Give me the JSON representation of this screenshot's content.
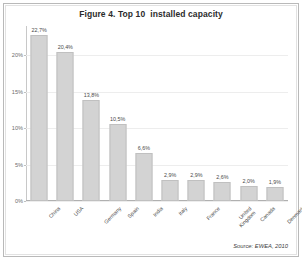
{
  "chart_data": {
    "type": "bar",
    "title": "Figure 4. Top 10  installed capacity",
    "xlabel": "",
    "ylabel": "",
    "ylim": [
      0,
      24
    ],
    "grid": true,
    "legend": "none",
    "orientation": "vertical",
    "categories": [
      "China",
      "USA",
      "Germany",
      "Spain",
      "India",
      "Italy",
      "France",
      "United\nKingdom",
      "Canada",
      "Denmark"
    ],
    "values": [
      22.7,
      20.4,
      13.8,
      10.5,
      6.6,
      2.9,
      2.9,
      2.6,
      2.0,
      1.9
    ],
    "data_labels": [
      "22,7%",
      "20,4%",
      "13,8%",
      "10,5%",
      "6,6%",
      "2,9%",
      "2,9%",
      "2,6%",
      "2,0%",
      "1,9%"
    ],
    "ytick_values": [
      0,
      5,
      10,
      15,
      20
    ],
    "ytick_labels": [
      "0%",
      "5%",
      "10%",
      "15%",
      "20%"
    ],
    "annotations": [
      "Source: EWEA, 2010"
    ],
    "colors": {
      "bar_fill": "#d3d3d3",
      "bar_border": "#c0c0c0",
      "gridline": "#ededed",
      "axis": "#b0b0b0",
      "text": "#4a4a4a",
      "background": "#ffffff"
    }
  },
  "source_note": "Source: EWEA, 2010"
}
